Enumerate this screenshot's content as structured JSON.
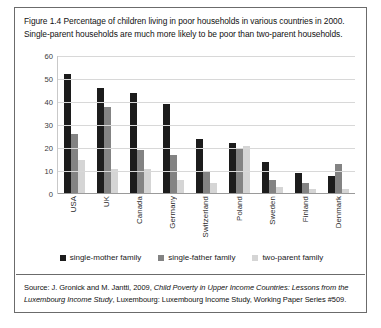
{
  "caption": "Figure 1.4 Percentage of children living in poor households in various countries in 2000. Single-parent households are much more likely to be poor than two-parent households.",
  "source": {
    "prefix": "Source: J. Gronick and M. Jantti, 2009, ",
    "italic_title": "Child Poverty in Upper Income Countries: Lessons from the Luxembourg Income Study",
    "suffix": ", Luxembourg: Luxembourg Income Study, Working Paper Series #509."
  },
  "chart_data": {
    "type": "bar",
    "title": "Percentage of children living in poor households in various countries in 2000",
    "xlabel": "",
    "ylabel": "",
    "ylim": [
      0,
      60
    ],
    "yticks": [
      0,
      10,
      20,
      30,
      40,
      50,
      60
    ],
    "grid": true,
    "legend_position": "bottom",
    "categories": [
      "USA",
      "UK",
      "Canada",
      "Germany",
      "Switzerland",
      "Poland",
      "Sweden",
      "Finland",
      "Denmark"
    ],
    "series": [
      {
        "name": "single-mother family",
        "color": "#1c1c1c",
        "values": [
          52,
          46,
          44,
          39,
          24,
          22,
          14,
          9,
          8
        ]
      },
      {
        "name": "single-father family",
        "color": "#838383",
        "values": [
          26,
          38,
          19,
          17,
          10,
          20,
          6,
          5,
          13
        ]
      },
      {
        "name": "two-parent family",
        "color": "#d5d5d5",
        "values": [
          15,
          11,
          11,
          6,
          5,
          21,
          3,
          2,
          2
        ]
      }
    ]
  }
}
